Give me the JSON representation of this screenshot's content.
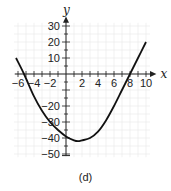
{
  "chart_data": {
    "type": "line",
    "title": "",
    "caption": "(d)",
    "xlabel": "x",
    "ylabel": "y",
    "xlim": [
      -7,
      11
    ],
    "ylim": [
      -52,
      35
    ],
    "grid": true,
    "x_ticks": [
      -6,
      -4,
      -2,
      2,
      4,
      6,
      8,
      10
    ],
    "x_tick_labels": [
      "-6",
      "-4",
      "-2",
      "2",
      "4",
      "6",
      "8",
      "10"
    ],
    "y_ticks": [
      30,
      20,
      10,
      -20,
      -30,
      -40,
      -50
    ],
    "y_tick_labels": [
      "30",
      "20",
      "10",
      "-20",
      "-30",
      "-40",
      "-50"
    ],
    "series": [
      {
        "name": "curve",
        "x": [
          -6.25,
          -5.25,
          -4,
          -3,
          -2,
          -1,
          0,
          1,
          1.5,
          2,
          3,
          4,
          5,
          6,
          7,
          8,
          9,
          10
        ],
        "y": [
          10,
          0,
          -14,
          -23,
          -30,
          -35,
          -39,
          -41.5,
          -42,
          -41.5,
          -40,
          -36,
          -29,
          -20,
          -10,
          0,
          10,
          20
        ]
      }
    ]
  }
}
